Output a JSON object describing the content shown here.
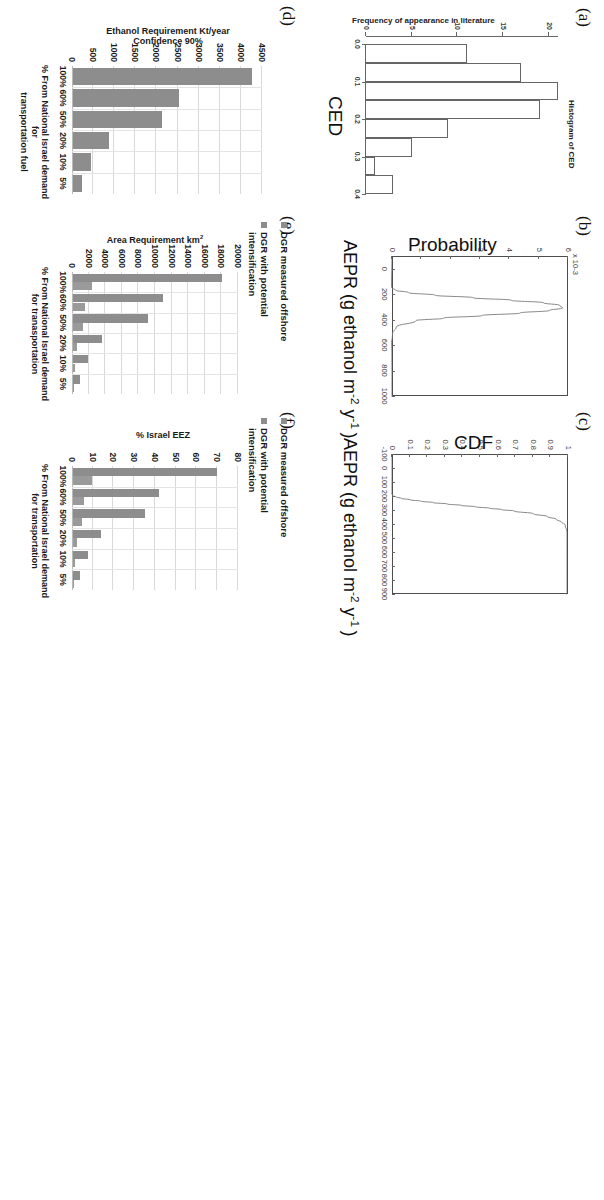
{
  "figure": {
    "panel_labels": [
      "(a)",
      "(b)",
      "(c)",
      "(d)",
      "(e)",
      "(f)"
    ]
  },
  "chart_data": [
    {
      "panel": "(a)",
      "type": "bar",
      "title": "Histogram of CED",
      "xlabel": "CED",
      "ylabel": "Frequency of appearance in literature",
      "xlim": [
        0.0,
        0.4
      ],
      "ylim": [
        0,
        21
      ],
      "xticks": [
        "0.0",
        "0.1",
        "0.2",
        "0.3",
        "0.4"
      ],
      "yticks": [
        "0",
        "5",
        "10",
        "15",
        "20"
      ],
      "bin_edges": [
        0.0,
        0.05,
        0.1,
        0.15,
        0.2,
        0.25,
        0.3,
        0.35,
        0.4
      ],
      "values": [
        11,
        17,
        21,
        19,
        9,
        5,
        1,
        3
      ],
      "grid": false
    },
    {
      "panel": "(b)",
      "type": "line",
      "title": "",
      "xlabel": "AEPR (g ethanol m-2 y-1)",
      "ylabel": "Probability",
      "y_exponent": "x 10-3",
      "xlim": [
        -100,
        1000
      ],
      "ylim": [
        0,
        6
      ],
      "xticks": [
        "0",
        "200",
        "400",
        "600",
        "800",
        "1000"
      ],
      "yticks": [
        "0",
        "1",
        "2",
        "3",
        "4",
        "5",
        "6"
      ],
      "x": [
        140,
        160,
        180,
        200,
        220,
        240,
        260,
        280,
        300,
        320,
        340,
        360,
        380,
        400,
        450,
        500,
        600,
        700,
        800,
        900,
        1000
      ],
      "y": [
        0.02,
        0.15,
        0.6,
        1.5,
        2.8,
        4.1,
        5.2,
        5.75,
        5.85,
        5.4,
        4.4,
        3.1,
        1.8,
        0.85,
        0.18,
        0.05,
        0.01,
        0.005,
        0.003,
        0.002,
        0.001
      ],
      "grid": false
    },
    {
      "panel": "(c)",
      "type": "line",
      "title": "",
      "xlabel": "AEPR (g ethanol m-2 y-1)",
      "ylabel": "CDF",
      "xlim": [
        -100,
        900
      ],
      "ylim": [
        0,
        1
      ],
      "xticks": [
        "-100",
        "0",
        "100",
        "200",
        "300",
        "400",
        "500",
        "600",
        "700",
        "800",
        "900"
      ],
      "yticks": [
        "0",
        "0.1",
        "0.2",
        "0.3",
        "0.4",
        "0.5",
        "0.6",
        "0.7",
        "0.8",
        "0.9",
        "1"
      ],
      "x": [
        170,
        190,
        200,
        210,
        220,
        230,
        240,
        250,
        260,
        270,
        280,
        290,
        300,
        320,
        340,
        360,
        380,
        400,
        450,
        500,
        600,
        700,
        800,
        900
      ],
      "y": [
        0.0,
        0.01,
        0.03,
        0.06,
        0.11,
        0.17,
        0.24,
        0.32,
        0.4,
        0.48,
        0.56,
        0.63,
        0.7,
        0.81,
        0.89,
        0.94,
        0.97,
        0.99,
        1.0,
        1.0,
        1.0,
        1.0,
        1.0,
        1.0
      ],
      "grid": false
    },
    {
      "panel": "(d)",
      "type": "bar",
      "title": "",
      "xlabel": "% From National Israel demand for transportation fuel",
      "ylabel": "Ethanol Requirement Kt/year Confidence 90%",
      "categories": [
        "100%",
        "60%",
        "50%",
        "20%",
        "10%",
        "5%"
      ],
      "values": [
        4250,
        2500,
        2120,
        850,
        420,
        215
      ],
      "ylim": [
        0,
        4500
      ],
      "yticks": [
        "0",
        "500",
        "1000",
        "1500",
        "2000",
        "2500",
        "3000",
        "3500",
        "4000",
        "4500"
      ],
      "grid": true,
      "legend": []
    },
    {
      "panel": "(e)",
      "type": "bar",
      "title": "",
      "xlabel": "% From National Israel demand for tranasportation",
      "ylabel": "Area Requirement km2",
      "categories": [
        "100%",
        "60%",
        "50%",
        "20%",
        "10%",
        "5%"
      ],
      "series": [
        {
          "name": "DGR measured offshore",
          "values": [
            18000,
            10800,
            9000,
            3550,
            1800,
            900
          ]
        },
        {
          "name": "DGR with potential intensification",
          "values": [
            2350,
            1420,
            1180,
            470,
            235,
            120
          ]
        }
      ],
      "ylim": [
        0,
        20000
      ],
      "yticks": [
        "0",
        "2000",
        "4000",
        "6000",
        "8000",
        "10000",
        "12000",
        "14000",
        "16000",
        "18000",
        "20000"
      ],
      "grid": true,
      "legend": [
        "DGR measured offshore",
        "DGR with potential\nintensification"
      ],
      "legend_position": "top-left"
    },
    {
      "panel": "(f)",
      "type": "bar",
      "title": "",
      "xlabel": "% From National Israel demand for transportation",
      "ylabel": "% Israel EEZ",
      "categories": [
        "100%",
        "60%",
        "50%",
        "20%",
        "10%",
        "5%"
      ],
      "series": [
        {
          "name": "DGR measured offshore",
          "values": [
            69.5,
            41.5,
            34.5,
            13.5,
            7.0,
            3.5
          ]
        },
        {
          "name": "DGR with potential intensification",
          "values": [
            9.0,
            5.5,
            4.5,
            1.8,
            0.9,
            0.5
          ]
        }
      ],
      "ylim": [
        0,
        80
      ],
      "yticks": [
        "0",
        "10",
        "20",
        "30",
        "40",
        "50",
        "60",
        "70",
        "80"
      ],
      "grid": true,
      "legend": [
        "DGR measured offshore",
        "DGR with potential\nintensification"
      ],
      "legend_position": "top-left"
    }
  ]
}
